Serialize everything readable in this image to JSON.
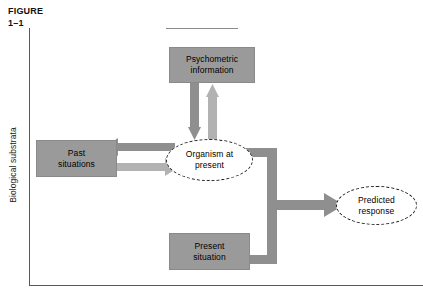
{
  "figure": {
    "label_line1": "FIGURE",
    "label_line2": "1–1"
  },
  "axis": {
    "y_label": "Biological substrata"
  },
  "diagram": {
    "type": "flow-diagram",
    "nodes": [
      {
        "id": "psychometric",
        "label_line1": "Psychometric",
        "label_line2": "information",
        "shape": "rect",
        "fill": "#9a9a9a"
      },
      {
        "id": "past",
        "label_line1": "Past",
        "label_line2": "situations",
        "shape": "rect",
        "fill": "#9a9a9a"
      },
      {
        "id": "organism",
        "label_line1": "Organism at",
        "label_line2": "present",
        "shape": "ellipse-dashed",
        "fill": "#ffffff"
      },
      {
        "id": "present",
        "label_line1": "Present",
        "label_line2": "situation",
        "shape": "rect",
        "fill": "#9a9a9a"
      },
      {
        "id": "predicted",
        "label_line1": "Predicted",
        "label_line2": "response",
        "shape": "ellipse-dashed",
        "fill": "#ffffff"
      }
    ],
    "edges": [
      {
        "from": "psychometric",
        "to": "organism",
        "direction": "down",
        "color": "#8f8f8f"
      },
      {
        "from": "organism",
        "to": "psychometric",
        "direction": "up",
        "color": "#b2b2b2"
      },
      {
        "from": "organism",
        "to": "past",
        "direction": "left",
        "color": "#8f8f8f"
      },
      {
        "from": "past",
        "to": "organism",
        "direction": "right",
        "color": "#b2b2b2"
      },
      {
        "from": "organism",
        "to": "predicted",
        "direction": "right",
        "color": "#8f8f8f"
      },
      {
        "from": "present",
        "to": "predicted",
        "direction": "right",
        "color": "#8f8f8f"
      }
    ]
  },
  "colors": {
    "box_fill": "#9a9a9a",
    "arrow_dark": "#8f8f8f",
    "arrow_light": "#b2b2b2",
    "frame_line": "#585858",
    "text": "#000000"
  }
}
